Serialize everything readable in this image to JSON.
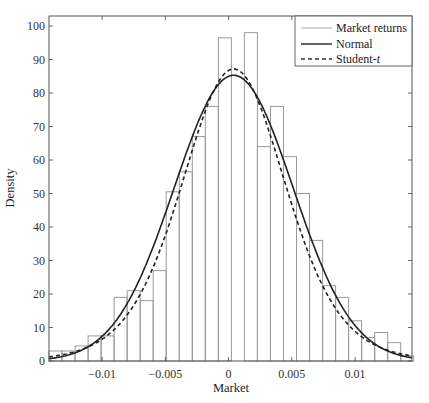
{
  "chart_data": {
    "type": "bar",
    "title": "",
    "xlabel": "Market",
    "ylabel": "Density",
    "xlim": [
      -0.0142,
      0.0145
    ],
    "ylim": [
      0,
      103
    ],
    "grid": false,
    "legend_position": "upper right",
    "x_ticks": [
      -0.01,
      -0.005,
      0,
      0.005,
      0.01
    ],
    "x_tick_labels": [
      "−0.01",
      "−0.005",
      "0",
      "0.005",
      "0.01"
    ],
    "y_ticks": [
      0,
      10,
      20,
      30,
      40,
      50,
      60,
      70,
      80,
      90,
      100
    ],
    "y_tick_labels": [
      "0",
      "10",
      "20",
      "30",
      "40",
      "50",
      "60",
      "70",
      "80",
      "90",
      "100"
    ],
    "histogram": {
      "name": "Market returns",
      "bin_start": -0.0142,
      "bin_width": 0.00103,
      "values": [
        3,
        3,
        4.5,
        7.5,
        7.5,
        19,
        21,
        18,
        27,
        50.5,
        56.5,
        67,
        76,
        96.5,
        0,
        98,
        64,
        76,
        61,
        50,
        36,
        22.5,
        19,
        12,
        7,
        8.5,
        5.5,
        1.5
      ],
      "color": "#9a9a9a"
    },
    "series": [
      {
        "name": "Normal",
        "style": "solid",
        "color": "#222222",
        "mean": 0.0004,
        "std": 0.0047,
        "peak": 85.3
      },
      {
        "name": "Student-t",
        "style": "dashed",
        "color": "#222222",
        "mean": 0.0004,
        "scale": 0.0042,
        "dof": 9,
        "peak": 87.2
      }
    ]
  },
  "legend": {
    "items": [
      {
        "label": "Market returns",
        "style": "thin-gray"
      },
      {
        "label": "Normal",
        "style": "solid"
      },
      {
        "label": "Student-",
        "italic_suffix": "t",
        "style": "dashed"
      }
    ]
  }
}
